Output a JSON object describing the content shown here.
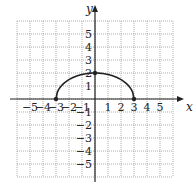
{
  "chart_data": {
    "type": "line",
    "title": "",
    "xlabel": "x",
    "ylabel": "y",
    "xlim": [
      -6,
      6
    ],
    "ylim": [
      -6,
      6
    ],
    "grid": true,
    "x_ticks": [
      "-5",
      "-4",
      "-3",
      "-2",
      "-1",
      "1",
      "2",
      "3",
      "4",
      "5"
    ],
    "y_ticks": [
      "5",
      "4",
      "3",
      "2",
      "1",
      "-1",
      "-2",
      "-3",
      "-4",
      "-5"
    ],
    "curve": "upper half of ellipse x^2/9 + y^2/4 = 1",
    "points": [
      {
        "x": -3,
        "y": 0
      },
      {
        "x": 0,
        "y": 2
      },
      {
        "x": 3,
        "y": 0
      }
    ],
    "series": [
      {
        "name": "semi-ellipse",
        "x": [
          -3,
          -2,
          -1,
          0,
          1,
          2,
          3
        ],
        "y": [
          0,
          1.49,
          1.89,
          2,
          1.89,
          1.49,
          0
        ]
      }
    ]
  },
  "colors": {
    "grid": "#9a9a9a",
    "axis": "#222222",
    "curve": "#222222"
  }
}
